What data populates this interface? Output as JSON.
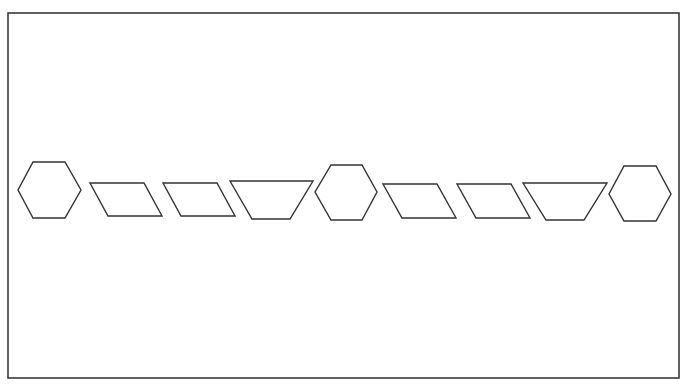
{
  "diagram": {
    "frame": {
      "x": 8,
      "y": 13,
      "width": 671,
      "height": 365
    },
    "colors": {
      "stroke": "#333333",
      "fill": "#ffffff",
      "frame": "#3a3a3a"
    },
    "shapes": [
      {
        "id": 1,
        "type": "hexagon",
        "points": "33,162 65,162 81,190 65,218 33,218 18,190"
      },
      {
        "id": 2,
        "type": "parallelogram",
        "points": "90,183 144,183 162,216 108,216"
      },
      {
        "id": 3,
        "type": "parallelogram",
        "points": "163,183 217,183 235,216 181,216"
      },
      {
        "id": 4,
        "type": "trapezoid",
        "points": "230,181 313,181 290,219 252,219"
      },
      {
        "id": 5,
        "type": "hexagon",
        "points": "331,165 362,165 377,192 362,220 331,220 315,192"
      },
      {
        "id": 6,
        "type": "parallelogram",
        "points": "383,184 437,184 456,218 402,218"
      },
      {
        "id": 7,
        "type": "parallelogram",
        "points": "457,184 511,184 530,218 476,218"
      },
      {
        "id": 8,
        "type": "trapezoid",
        "points": "523,183 607,183 584,220 546,220"
      },
      {
        "id": 9,
        "type": "hexagon",
        "points": "624,166 656,166 671,194 656,221 624,221 609,194"
      }
    ]
  }
}
